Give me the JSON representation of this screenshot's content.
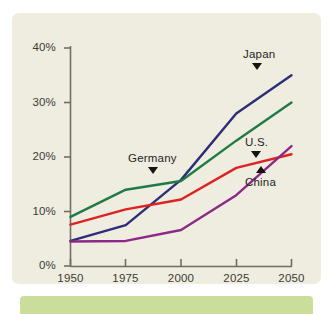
{
  "chart_data": {
    "type": "line",
    "title": "",
    "subtitle": "",
    "xlabel": "",
    "ylabel": "",
    "x": [
      1950,
      1975,
      2000,
      2025,
      2050
    ],
    "xtick_labels": [
      "1950",
      "1975",
      "2000",
      "2025",
      "2050"
    ],
    "ytick_labels": [
      "0%",
      "10%",
      "20%",
      "30%",
      "40%"
    ],
    "ytick_values": [
      0,
      10,
      20,
      30,
      40
    ],
    "xlim": [
      1950,
      2050
    ],
    "ylim": [
      0,
      40
    ],
    "grid": false,
    "legend_position": "inline-annotations",
    "series": [
      {
        "name": "Japan",
        "color": "#2d2d78",
        "values": [
          4.6,
          7.5,
          15.8,
          28.0,
          35.0
        ],
        "annotation": {
          "label": "Japan",
          "marker": "triangle-down",
          "points_to_year": 2040,
          "points_to_value": 32.0
        }
      },
      {
        "name": "Germany",
        "color": "#1f7a45",
        "values": [
          9.0,
          14.0,
          15.6,
          23.0,
          30.0
        ],
        "annotation": {
          "label": "Germany",
          "marker": "triangle-down",
          "points_to_year": 1990,
          "points_to_value": 15.2
        }
      },
      {
        "name": "U.S.",
        "color": "#dd2222",
        "values": [
          7.6,
          10.4,
          12.2,
          18.0,
          20.5
        ],
        "annotation": {
          "label": "U.S.",
          "marker": "triangle-down",
          "points_to_year": 2038,
          "points_to_value": 19.6
        }
      },
      {
        "name": "China",
        "color": "#8b2a86",
        "values": [
          4.5,
          4.6,
          6.6,
          13.0,
          22.0
        ],
        "annotation": {
          "label": "China",
          "marker": "triangle-up",
          "points_to_year": 2041,
          "points_to_value": 17.5
        }
      }
    ]
  },
  "axes": {
    "yticks": [
      {
        "label": "40%"
      },
      {
        "label": "30%"
      },
      {
        "label": "20%"
      },
      {
        "label": "10%"
      },
      {
        "label": "0%"
      }
    ],
    "xticks": [
      {
        "label": "1950"
      },
      {
        "label": "1975"
      },
      {
        "label": "2000"
      },
      {
        "label": "2025"
      },
      {
        "label": "2050"
      }
    ]
  },
  "annotations": {
    "japan": "Japan",
    "germany": "Germany",
    "us": "U.S.",
    "china": "China"
  },
  "colors": {
    "panel_background": "#efeddf",
    "page_background": "#ffffff",
    "axis": "#6e6e62",
    "bottom_band": "#cadd9a",
    "text": "#3b3b35",
    "japan": "#2d2d78",
    "germany": "#1f7a45",
    "us": "#dd2222",
    "china": "#8b2a86"
  }
}
